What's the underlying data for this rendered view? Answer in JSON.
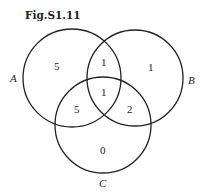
{
  "figure": {
    "title": "Fig.S1.11"
  },
  "sets": [
    {
      "name": "A",
      "cx": 72,
      "cy": 78,
      "r": 49
    },
    {
      "name": "B",
      "cx": 135,
      "cy": 78,
      "r": 48
    },
    {
      "name": "C",
      "cx": 103,
      "cy": 125,
      "r": 48
    }
  ],
  "labels": {
    "A": "A",
    "B": "B",
    "C": "C"
  },
  "regions": {
    "A_only": "5",
    "A_and_B_only": "1",
    "B_only": "1",
    "A_and_B_and_C": "1",
    "A_and_C_only": "5",
    "B_and_C_only": "2",
    "C_only": "0"
  }
}
